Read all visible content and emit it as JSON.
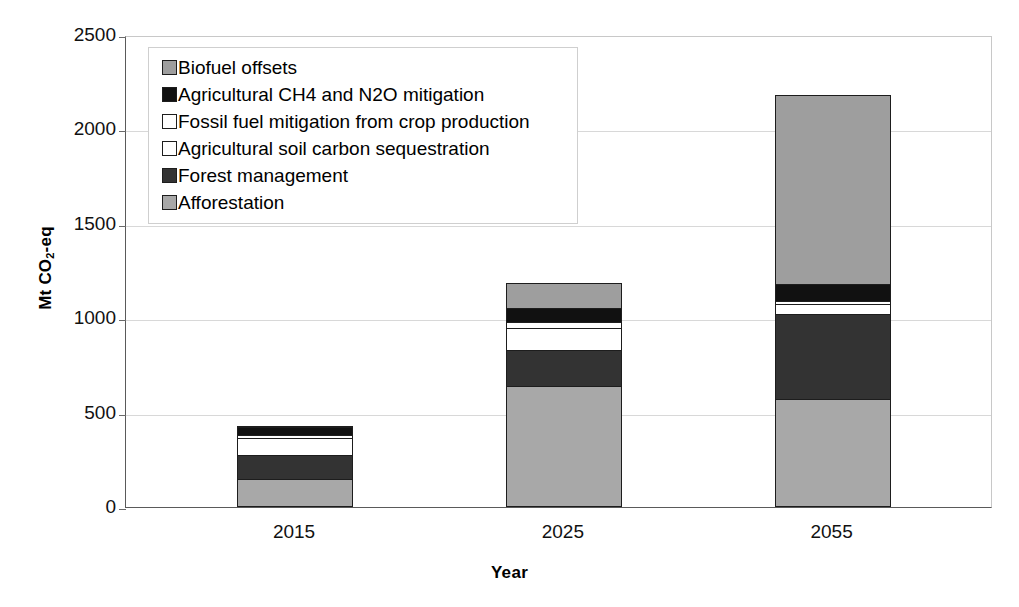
{
  "chart_data": {
    "type": "bar",
    "stacked": true,
    "title": "",
    "xlabel": "Year",
    "ylabel": "Mt CO2-eq",
    "ylabel_parts": {
      "prefix": "Mt CO",
      "sub": "2",
      "suffix": "-eq"
    },
    "categories": [
      "2015",
      "2025",
      "2055"
    ],
    "ylim": [
      0,
      2500
    ],
    "yticks": [
      0,
      500,
      1000,
      1500,
      2000,
      2500
    ],
    "ytick_labels": [
      "0",
      "500",
      "1000",
      "1500",
      "2000",
      "2500"
    ],
    "grid": true,
    "legend_position": "upper-left-inside",
    "series": [
      {
        "name": "Afforestation",
        "color": "#a8a8a8",
        "values": [
          150,
          640,
          570
        ]
      },
      {
        "name": "Forest management",
        "color": "#333333",
        "values": [
          130,
          195,
          460
        ]
      },
      {
        "name": "Agricultural soil carbon sequestration",
        "color": "#ffffff",
        "values": [
          95,
          125,
          55
        ]
      },
      {
        "name": "Fossil fuel mitigation from crop production",
        "color": "#ffffff",
        "values": [
          25,
          35,
          20
        ]
      },
      {
        "name": "Agricultural CH4 and N2O mitigation",
        "color": "#111111",
        "values": [
          45,
          80,
          95
        ]
      },
      {
        "name": "Biofuel offsets",
        "color": "#9e9e9e",
        "values": [
          5,
          140,
          1010
        ]
      }
    ],
    "totals": [
      450,
      1215,
      2210
    ]
  },
  "legend": {
    "items": [
      {
        "label": "Biofuel offsets",
        "color": "#9e9e9e"
      },
      {
        "label": "Agricultural CH4 and N2O mitigation",
        "color": "#111111"
      },
      {
        "label": "Fossil fuel mitigation from crop production",
        "color": "#ffffff"
      },
      {
        "label": "Agricultural soil carbon sequestration",
        "color": "#ffffff"
      },
      {
        "label": "Forest management",
        "color": "#333333"
      },
      {
        "label": "Afforestation",
        "color": "#a8a8a8"
      }
    ]
  },
  "axes": {
    "y_title_prefix": "Mt CO",
    "y_title_sub": "2",
    "y_title_suffix": "-eq",
    "x_title": "Year"
  }
}
